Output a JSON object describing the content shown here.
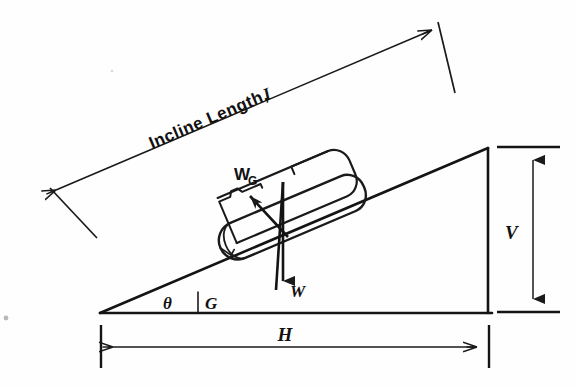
{
  "figure": {
    "background_color": "#fefefe",
    "line_color": "#1a1a1a"
  },
  "labels": {
    "incline_length": "Incline Length,",
    "incline_length_symbol": "I",
    "vertical_rise": "V",
    "horizontal_run": "H",
    "angle": "θ",
    "ground_point": "G",
    "weight": "W",
    "weight_component": "W",
    "weight_component_subscript": "G"
  },
  "geometry": {
    "triangle": {
      "left_vertex": [
        100,
        313
      ],
      "apex": [
        488,
        148
      ],
      "right_vertex": [
        488,
        313
      ]
    },
    "incline_angle_degrees": 23,
    "dimension_lines": {
      "incline_length": {
        "from": [
          52,
          193
        ],
        "to": [
          436,
          28
        ]
      },
      "vertical": {
        "x": 533,
        "from_y": 148,
        "to_y": 312
      },
      "horizontal": {
        "y": 347,
        "from_x": 101,
        "to_x": 489
      }
    },
    "drum": {
      "center": [
        288,
        205
      ],
      "length": 175,
      "diameter": 62,
      "tilt_degrees": 23
    },
    "force_vectors": {
      "weight": {
        "from": [
          283,
          182
        ],
        "to": [
          283,
          292
        ],
        "direction": "down"
      },
      "weight_component": {
        "from": [
          288,
          237
        ],
        "to": [
          243,
          198
        ],
        "direction": "up-left along incline"
      }
    }
  }
}
